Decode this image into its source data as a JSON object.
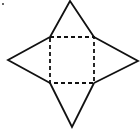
{
  "diagram": {
    "stroke_color": "#111111",
    "background": "#ffffff",
    "base_square": {
      "style": "dashed",
      "x": 50,
      "y": 37,
      "width": 44,
      "height": 46
    },
    "triangles": [
      {
        "name": "top",
        "apex": [
          70,
          1
        ],
        "base": [
          [
            50,
            37
          ],
          [
            94,
            37
          ]
        ]
      },
      {
        "name": "right",
        "apex": [
          138,
          61
        ],
        "base": [
          [
            94,
            37
          ],
          [
            94,
            83
          ]
        ]
      },
      {
        "name": "bottom",
        "apex": [
          72,
          127
        ],
        "base": [
          [
            50,
            83
          ],
          [
            94,
            83
          ]
        ]
      },
      {
        "name": "left",
        "apex": [
          8,
          60
        ],
        "base": [
          [
            50,
            37
          ],
          [
            50,
            83
          ]
        ]
      }
    ],
    "marker_dot": {
      "x": 3,
      "y": 4
    }
  }
}
